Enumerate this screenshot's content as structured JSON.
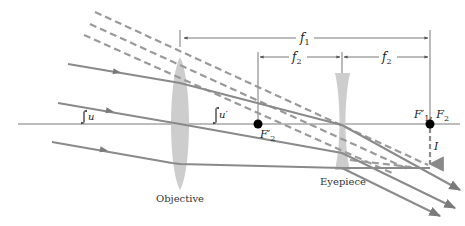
{
  "diagram": {
    "colors": {
      "ray": "#8a8a8a",
      "dashed_ray": "#9a9a9a",
      "lens": "#c8c8c8",
      "axis": "#7a7a7a",
      "dimension": "#555555",
      "point": "#000000",
      "text": "#222222"
    },
    "labels": {
      "objective": "Objective",
      "eyepiece": "Eyepiece",
      "f1": "f",
      "f1_sub": "1",
      "f2_left": "f",
      "f2_left_sub": "2",
      "f2_right": "f",
      "f2_right_sub": "2",
      "angle_u": "u",
      "angle_u_prime": "u′",
      "focal_point_f2_prime": "F",
      "focal_point_f2_prime_sub": "2",
      "focal_point_f2_prime_mark": "′",
      "focal_points_combined_a": "F",
      "focal_points_combined_a_sub": "1",
      "focal_points_combined_a_mark": "′",
      "focal_points_combined_sep": ", ",
      "focal_points_combined_b": "F",
      "focal_points_combined_b_sub": "2",
      "image": "I"
    }
  }
}
